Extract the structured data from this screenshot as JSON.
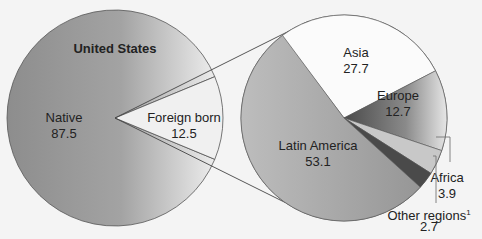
{
  "chart_data": [
    {
      "type": "pie",
      "title": "United States",
      "slices": [
        {
          "label": "Native",
          "value": 87.5
        },
        {
          "label": "Foreign born",
          "value": 12.5
        }
      ]
    },
    {
      "type": "pie",
      "title": "",
      "parent_slice": "Foreign born",
      "slices": [
        {
          "label": "Asia",
          "value": 27.7
        },
        {
          "label": "Europe",
          "value": 12.7
        },
        {
          "label": "Africa",
          "value": 3.9
        },
        {
          "label": "Other regions",
          "footnote": "1",
          "value": 2.7
        },
        {
          "label": "Latin America",
          "value": 53.1
        }
      ]
    }
  ],
  "colors": {
    "native": "#9a9a9a",
    "foreign": "#f0f0f0",
    "asia": "#fbfbfb",
    "europe": "#6e6e6e",
    "africa": "#c8c8c8",
    "other": "#4a4a4a",
    "latin": "#a8a8a8"
  }
}
